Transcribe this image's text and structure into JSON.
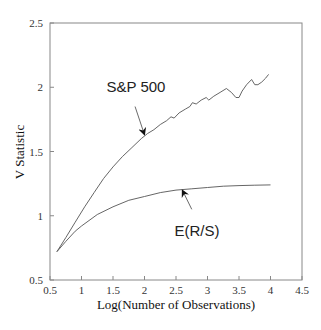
{
  "chart_data": {
    "type": "line",
    "title": "",
    "xlabel": "Log(Number of Observations)",
    "ylabel": "V Statistic",
    "xlim": [
      0.5,
      4.5
    ],
    "ylim": [
      0.5,
      2.5
    ],
    "xticks": [
      0.5,
      1,
      1.5,
      2,
      2.5,
      3,
      3.5,
      4,
      4.5
    ],
    "xtick_labels": [
      "0.5",
      "1",
      "1.5",
      "2",
      "2.5",
      "3",
      "3.5",
      "4",
      "4.5"
    ],
    "yticks": [
      0.5,
      1,
      1.5,
      2,
      2.5
    ],
    "ytick_labels": [
      "0.5",
      "1",
      "1.5",
      "2",
      "2.5"
    ],
    "grid": false,
    "legend": null,
    "series": [
      {
        "name": "S&P 500",
        "x": [
          0.61,
          0.75,
          0.9,
          1.05,
          1.2,
          1.35,
          1.5,
          1.65,
          1.8,
          1.95,
          2.05,
          2.15,
          2.25,
          2.35,
          2.42,
          2.47,
          2.55,
          2.65,
          2.72,
          2.76,
          2.82,
          2.9,
          2.98,
          3.02,
          3.1,
          3.2,
          3.3,
          3.38,
          3.45,
          3.5,
          3.55,
          3.62,
          3.7,
          3.75,
          3.8,
          3.86,
          3.92,
          3.97
        ],
        "y": [
          0.72,
          0.83,
          0.95,
          1.07,
          1.18,
          1.29,
          1.38,
          1.46,
          1.53,
          1.6,
          1.64,
          1.67,
          1.71,
          1.74,
          1.77,
          1.76,
          1.8,
          1.83,
          1.85,
          1.88,
          1.87,
          1.9,
          1.92,
          1.9,
          1.93,
          1.96,
          1.99,
          1.96,
          1.92,
          1.92,
          1.97,
          2.02,
          2.06,
          2.02,
          2.02,
          2.04,
          2.07,
          2.1
        ]
      },
      {
        "name": "E(R/S)",
        "x": [
          0.61,
          0.75,
          0.9,
          1.0,
          1.25,
          1.5,
          1.75,
          2.0,
          2.25,
          2.5,
          2.75,
          3.0,
          3.25,
          3.5,
          3.75,
          4.0
        ],
        "y": [
          0.72,
          0.8,
          0.88,
          0.92,
          1.01,
          1.07,
          1.12,
          1.15,
          1.18,
          1.2,
          1.21,
          1.22,
          1.23,
          1.235,
          1.238,
          1.24
        ]
      }
    ],
    "annotations": [
      {
        "text": "S&P 500",
        "text_x": 2.25,
        "text_y": 2.02,
        "arrow_from": [
          1.85,
          1.85
        ],
        "arrow_to": [
          2.0,
          1.63
        ]
      },
      {
        "text": "E(R/S)",
        "text_x": 2.85,
        "text_y": 0.92,
        "arrow_from": [
          2.75,
          1.05
        ],
        "arrow_to": [
          2.6,
          1.2
        ]
      }
    ]
  },
  "axes": {
    "xlabel": "Log(Number of Observations)",
    "ylabel": "V Statistic"
  },
  "annotations": {
    "sp500": "S&P 500",
    "ers": "E(R/S)"
  },
  "colors": {
    "line": "#555555",
    "axis": "#888888",
    "text": "#222222"
  }
}
